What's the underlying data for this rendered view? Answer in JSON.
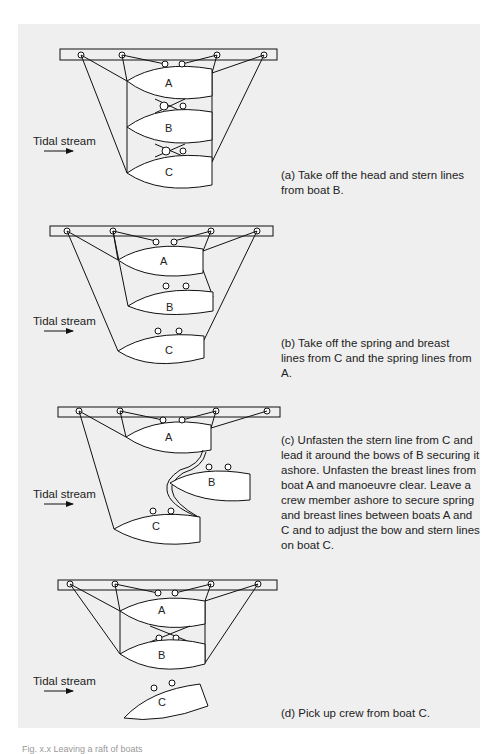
{
  "figure": {
    "tidal_label": "Tidal stream",
    "panels": [
      {
        "id": "a",
        "boats": [
          "A",
          "B",
          "C"
        ],
        "caption": "(a) Take off the head and stern lines from boat B."
      },
      {
        "id": "b",
        "boats": [
          "A",
          "B",
          "C"
        ],
        "caption": "(b) Take off the spring and breast lines from C and the spring lines from A."
      },
      {
        "id": "c",
        "boats": [
          "A",
          "B",
          "C"
        ],
        "caption": "(c) Unfasten the stern line from C and lead it around the bows of B securing it ashore. Unfasten the breast lines from boat A and manoeuvre clear. Leave a crew member ashore to secure spring and breast lines between boats A and C and to adjust the bow and stern lines on boat C."
      },
      {
        "id": "d",
        "boats": [
          "A",
          "B",
          "C"
        ],
        "caption": "(d) Pick up crew from boat C."
      }
    ],
    "figure_caption": "Fig. x.x Leaving a raft of boats"
  }
}
